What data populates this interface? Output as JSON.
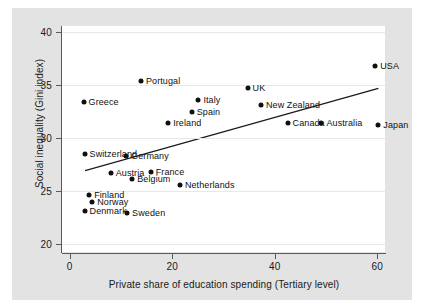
{
  "chart_data": {
    "type": "scatter",
    "title": "",
    "xlabel": "Private share of education spending (Tertiary level)",
    "ylabel": "Social inequality (Gini index)",
    "xlim": [
      -1.5,
      61.5
    ],
    "ylim": [
      19.2,
      40.6
    ],
    "xticks": [
      0,
      20,
      40,
      60
    ],
    "yticks": [
      20,
      25,
      30,
      35,
      40
    ],
    "xtick_labels": [
      "0",
      "20",
      "40",
      "60"
    ],
    "ytick_labels": [
      "20",
      "25",
      "30",
      "35",
      "40"
    ],
    "grid": "horizontal",
    "legend": "none",
    "points": [
      {
        "label": "Greece",
        "x": 2.7,
        "y": 33.4,
        "label_side": "right"
      },
      {
        "label": "Portugal",
        "x": 13.9,
        "y": 35.4,
        "label_side": "right"
      },
      {
        "label": "Italy",
        "x": 25.1,
        "y": 33.6,
        "label_side": "right"
      },
      {
        "label": "Spain",
        "x": 23.8,
        "y": 32.5,
        "label_side": "right"
      },
      {
        "label": "Ireland",
        "x": 19.2,
        "y": 31.4,
        "label_side": "right"
      },
      {
        "label": "UK",
        "x": 34.7,
        "y": 34.7,
        "label_side": "right"
      },
      {
        "label": "New Zealand",
        "x": 37.3,
        "y": 33.1,
        "label_side": "right"
      },
      {
        "label": "Canada",
        "x": 42.5,
        "y": 31.4,
        "label_side": "right"
      },
      {
        "label": "Australia",
        "x": 49.1,
        "y": 31.4,
        "label_side": "right"
      },
      {
        "label": "USA",
        "x": 59.6,
        "y": 36.8,
        "label_side": "right"
      },
      {
        "label": "Japan",
        "x": 60.2,
        "y": 31.2,
        "label_side": "right"
      },
      {
        "label": "Switzerland",
        "x": 2.9,
        "y": 28.5,
        "label_side": "right"
      },
      {
        "label": "Germany",
        "x": 11.0,
        "y": 28.3,
        "label_side": "right"
      },
      {
        "label": "Austria",
        "x": 8.0,
        "y": 26.7,
        "label_side": "right"
      },
      {
        "label": "France",
        "x": 15.8,
        "y": 26.8,
        "label_side": "right"
      },
      {
        "label": "Belgium",
        "x": 12.2,
        "y": 26.1,
        "label_side": "right"
      },
      {
        "label": "Netherlands",
        "x": 21.5,
        "y": 25.5,
        "label_side": "right"
      },
      {
        "label": "Finland",
        "x": 3.8,
        "y": 24.6,
        "label_side": "right"
      },
      {
        "label": "Norway",
        "x": 4.4,
        "y": 23.9,
        "label_side": "right"
      },
      {
        "label": "Denmark",
        "x": 2.9,
        "y": 23.1,
        "label_side": "right"
      },
      {
        "label": "Sweden",
        "x": 11.2,
        "y": 22.9,
        "label_side": "right"
      }
    ],
    "trendline": {
      "x_start": 3.0,
      "y_start": 26.9,
      "x_end": 60.2,
      "y_end": 34.7,
      "color": "#1a1a1a"
    },
    "marker_color": "#101010",
    "plot_background": "#ffffff",
    "figure_background": "#e3e3e3",
    "grid_color": "#e8e8e8"
  }
}
